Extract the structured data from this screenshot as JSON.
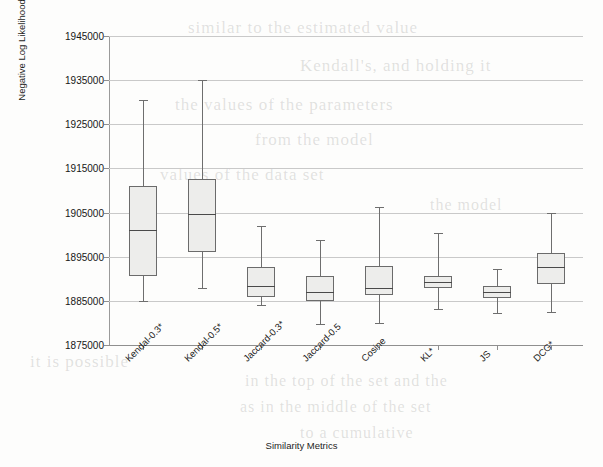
{
  "page": {
    "width": 603,
    "height": 467,
    "background": "#fdfdfc"
  },
  "bleed_text": [
    {
      "text": "similar to the estimated value",
      "x": 188,
      "y": 18,
      "size": 17
    },
    {
      "text": "Kendall's, and holding it",
      "x": 300,
      "y": 56,
      "size": 17
    },
    {
      "text": "the values of the parameters",
      "x": 175,
      "y": 95,
      "size": 17
    },
    {
      "text": "from the model",
      "x": 255,
      "y": 130,
      "size": 17
    },
    {
      "text": "values of the data set",
      "x": 160,
      "y": 165,
      "size": 17
    },
    {
      "text": "the model",
      "x": 430,
      "y": 196,
      "size": 16
    },
    {
      "text": "it is possible",
      "x": 30,
      "y": 352,
      "size": 17
    },
    {
      "text": "in the top of the set and the",
      "x": 245,
      "y": 372,
      "size": 16
    },
    {
      "text": "as in the middle of the set",
      "x": 240,
      "y": 398,
      "size": 16
    },
    {
      "text": "to a cumulative",
      "x": 300,
      "y": 424,
      "size": 16
    }
  ],
  "chart_data": {
    "type": "box",
    "title": "",
    "xlabel": "Similarity Metrics",
    "ylabel": "Negative Log Likelihood",
    "ylim": [
      1875000,
      1945000
    ],
    "ytick_step": 10000,
    "yticks": [
      1945000,
      1935000,
      1925000,
      1915000,
      1905000,
      1895000,
      1885000,
      1875000
    ],
    "ytick_labels": [
      "1945000",
      "1935000",
      "1925000",
      "1915000",
      "1905000",
      "1895000",
      "1885000",
      "1875000"
    ],
    "grid": true,
    "legend": "none",
    "box_fill": "#ededeb",
    "box_stroke": "#6b6b6b",
    "categories": [
      "Kendal-0.3*",
      "Kendal-0.5*",
      "Jaccard-0.3*",
      "Jaccard-0.5",
      "Cosine",
      "KL*",
      "JS",
      "DCG*"
    ],
    "boxes": [
      {
        "label": "Kendal-0.3*",
        "whisker_low": 1885000,
        "q1": 1890700,
        "median": 1901100,
        "q3": 1911000,
        "whisker_high": 1930500
      },
      {
        "label": "Kendal-0.5*",
        "whisker_low": 1887900,
        "q1": 1896100,
        "median": 1904700,
        "q3": 1912600,
        "whisker_high": 1935000
      },
      {
        "label": "Jaccard-0.3*",
        "whisker_low": 1884100,
        "q1": 1885900,
        "median": 1888400,
        "q3": 1892700,
        "whisker_high": 1901900
      },
      {
        "label": "Jaccard-0.5",
        "whisker_low": 1879800,
        "q1": 1885000,
        "median": 1887000,
        "q3": 1890700,
        "whisker_high": 1898800
      },
      {
        "label": "Cosine",
        "whisker_low": 1880000,
        "q1": 1886300,
        "median": 1887900,
        "q3": 1892900,
        "whisker_high": 1906300
      },
      {
        "label": "KL*",
        "whisker_low": 1883200,
        "q1": 1887900,
        "median": 1889300,
        "q3": 1890600,
        "whisker_high": 1900400
      },
      {
        "label": "JS",
        "whisker_low": 1882300,
        "q1": 1885600,
        "median": 1886900,
        "q3": 1888300,
        "whisker_high": 1892200
      },
      {
        "label": "DCG*",
        "whisker_low": 1882500,
        "q1": 1888800,
        "median": 1892700,
        "q3": 1895800,
        "whisker_high": 1904900
      }
    ]
  },
  "geometry": {
    "plot_left": 109,
    "plot_right": 583,
    "plot_top": 36,
    "plot_bottom": 345,
    "box_width": 28,
    "centers": [
      143,
      202,
      261,
      320,
      379,
      438,
      497,
      551
    ]
  }
}
